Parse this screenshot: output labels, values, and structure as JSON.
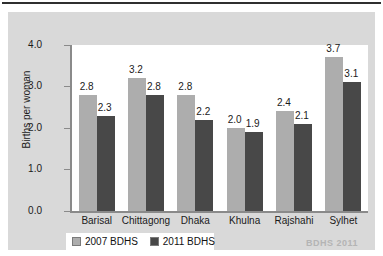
{
  "chart_data": {
    "type": "bar",
    "title": "",
    "xlabel": "",
    "ylabel": "Births per woman",
    "ylim": [
      0.0,
      4.0
    ],
    "yticks": [
      "0.0",
      "1.0",
      "2.0",
      "3.0",
      "4.0"
    ],
    "grid": false,
    "legend_position": "bottom-left",
    "categories": [
      "Barisal",
      "Chittagong",
      "Dhaka",
      "Khulna",
      "Rajshahi",
      "Sylhet"
    ],
    "series": [
      {
        "name": "2007 BDHS",
        "color": "#adadad",
        "values": [
          2.8,
          3.2,
          2.8,
          2.0,
          2.4,
          3.7
        ]
      },
      {
        "name": "2011 BDHS",
        "color": "#484848",
        "values": [
          2.3,
          2.8,
          2.2,
          1.9,
          2.1,
          3.1
        ]
      }
    ],
    "bar_labels": {
      "2007 BDHS": [
        "2.8",
        "3.2",
        "2.8",
        "2.0",
        "2.4",
        "3.7"
      ],
      "2011 BDHS": [
        "2.3",
        "2.8",
        "2.2",
        "1.9",
        "2.1",
        "3.1"
      ]
    },
    "annotations": [
      "BDHS 2011"
    ]
  },
  "legend": {
    "items": [
      {
        "label": "2007 BDHS"
      },
      {
        "label": "2011 BDHS"
      }
    ]
  },
  "watermark": {
    "text": "BDHS 2011"
  },
  "colors": {
    "series_2007": "#adadad",
    "series_2011": "#484848",
    "panel_background": "#d9d9d9",
    "plot_background": "#ffffff",
    "axis": "#8a8a8a"
  }
}
